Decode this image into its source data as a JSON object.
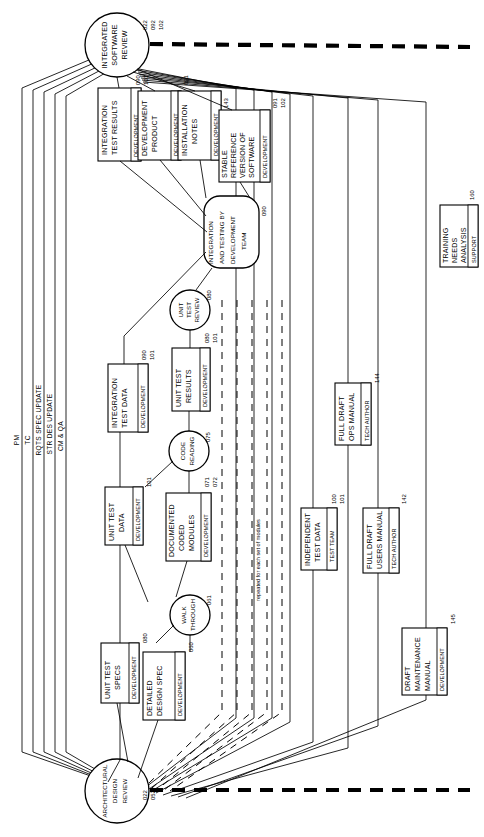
{
  "diagram": {
    "orientation": "rotated-90-ccw",
    "note_label": "repeated for each set of modules",
    "lanes": [
      {
        "id": "pm",
        "label": "PM"
      },
      {
        "id": "tc",
        "label": "TC"
      },
      {
        "id": "rqts",
        "label": "RQTS SPEC UPDATE"
      },
      {
        "id": "strdes",
        "label": "STR DES UPDATE"
      },
      {
        "id": "cmqa",
        "label": "CM & QA"
      }
    ],
    "review_nodes": [
      {
        "id": "integrated-software-review",
        "label_lines": [
          "INTEGRATED",
          "SOFTWARE",
          "REVIEW"
        ],
        "tags": [
          "022",
          "092",
          "102"
        ],
        "shape": "circle"
      },
      {
        "id": "architectural-design-review",
        "label_lines": [
          "ARCHITECTURAL",
          "DESIGN",
          "REVIEW"
        ],
        "tags": [
          "022",
          "052"
        ],
        "shape": "circle"
      }
    ],
    "process_nodes": [
      {
        "id": "integration-and-testing-by-development-team",
        "label_lines": [
          "INTEGRATION",
          "AND TESTING BY",
          "DEVELOPMENT",
          "TEAM"
        ],
        "tags": [
          "090"
        ],
        "shape": "rounded-rect"
      },
      {
        "id": "unit-test-review",
        "label_lines": [
          "UNIT",
          "TEST",
          "REVIEW"
        ],
        "tags": [
          "080"
        ],
        "shape": "circle"
      },
      {
        "id": "code-reading",
        "label_lines": [
          "CODE",
          "READING"
        ],
        "tags": [
          "075"
        ],
        "shape": "circle"
      },
      {
        "id": "walk-through",
        "label_lines": [
          "WALK",
          "THROUGH"
        ],
        "tags": [
          "061"
        ],
        "shape": "circle"
      }
    ],
    "artifact_boxes": [
      {
        "id": "integration-test-results",
        "label_lines": [
          "INTEGRATION",
          "TEST RESULTS"
        ],
        "role": "DEVELOPMENT",
        "tags": [
          "090",
          "101"
        ]
      },
      {
        "id": "development-product",
        "label_lines": [
          "DEVELOPMENT",
          "PRODUCT"
        ],
        "role": "DEVELOPMENT",
        "tags": [
          "091"
        ]
      },
      {
        "id": "installation-notes",
        "label_lines": [
          "INSTALLATION",
          "NOTES"
        ],
        "role": "DEVELOPMENT",
        "tags": [
          "143"
        ]
      },
      {
        "id": "stable-reference-version-of-software",
        "label_lines": [
          "STABLE",
          "REFERENCE",
          "VERSION OF",
          "SOFTWARE"
        ],
        "role": "DEVELOPMENT",
        "tags": [
          "091",
          "102"
        ]
      },
      {
        "id": "training-needs-analysis",
        "label_lines": [
          "TRAINING",
          "NEEDS",
          "ANALYSIS"
        ],
        "role": "SUPPORT",
        "tags": [
          "160"
        ]
      },
      {
        "id": "unit-test-results",
        "label_lines": [
          "UNIT TEST",
          "RESULTS"
        ],
        "role": "DEVELOPMENT",
        "tags": [
          "080",
          "101"
        ]
      },
      {
        "id": "integration-test-data",
        "label_lines": [
          "INTEGRATION",
          "TEST DATA"
        ],
        "role": "DEVELOPMENT",
        "tags": [
          "090",
          "101"
        ]
      },
      {
        "id": "unit-test-data",
        "label_lines": [
          "UNIT TEST",
          "DATA"
        ],
        "role": "DEVELOPMENT",
        "tags": [
          "101"
        ]
      },
      {
        "id": "documented-coded-modules",
        "label_lines": [
          "DOCUMENTED",
          "CODED",
          "MODULES"
        ],
        "role": "DEVELOPMENT",
        "tags": [
          "071",
          "072"
        ]
      },
      {
        "id": "unit-test-specs",
        "label_lines": [
          "UNIT TEST",
          "SPECS"
        ],
        "role": "DEVELOPMENT",
        "tags": [
          "080"
        ]
      },
      {
        "id": "detailed-design-spec",
        "label_lines": [
          "DETAILED",
          "DESIGN SPEC"
        ],
        "role": "DEVELOPMENT",
        "tags": [
          "060"
        ]
      },
      {
        "id": "full-draft-ops-manual",
        "label_lines": [
          "FULL DRAFT",
          "OPS MANUAL"
        ],
        "role": "TECH AUTHOR",
        "tags": [
          "144"
        ]
      },
      {
        "id": "independent-test-data",
        "label_lines": [
          "INDEPENDENT",
          "TEST DATA"
        ],
        "role": "TEST TEAM",
        "tags": [
          "100",
          "101"
        ]
      },
      {
        "id": "full-draft-users-manual",
        "label_lines": [
          "FULL DRAFT",
          "USERS MANUAL"
        ],
        "role": "TECH AUTHOR",
        "tags": [
          "142"
        ]
      },
      {
        "id": "draft-maintenance-manual",
        "label_lines": [
          "DRAFT",
          "MAINTENANCE",
          "MANUAL"
        ],
        "role": "DEVELOPMENT",
        "tags": [
          "145"
        ]
      }
    ],
    "colors": {
      "stroke": "#000000",
      "background": "#ffffff"
    }
  }
}
